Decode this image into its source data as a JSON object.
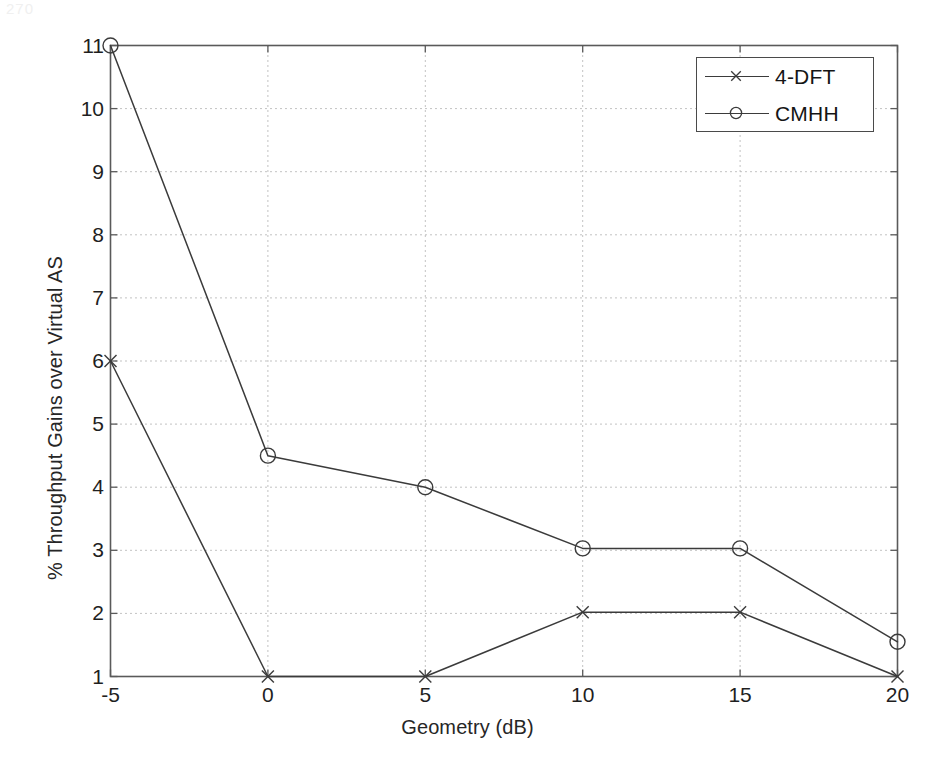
{
  "page": {
    "scan_artifact": "270"
  },
  "chart_data": {
    "type": "line",
    "title": "",
    "xlabel": "Geometry (dB)",
    "ylabel": "% Throughput Gains over Virtual AS",
    "x": [
      -5,
      0,
      5,
      10,
      15,
      20
    ],
    "xlim": [
      -5,
      20
    ],
    "ylim": [
      1,
      11
    ],
    "xticks": [
      "-5",
      "0",
      "5",
      "10",
      "15",
      "20"
    ],
    "yticks": [
      "1",
      "2",
      "3",
      "4",
      "5",
      "6",
      "7",
      "8",
      "9",
      "10",
      "11"
    ],
    "xtick_values": [
      -5,
      0,
      5,
      10,
      15,
      20
    ],
    "ytick_values": [
      1,
      2,
      3,
      4,
      5,
      6,
      7,
      8,
      9,
      10,
      11
    ],
    "grid": "dotted",
    "grid_color": "#bbbbbb",
    "legend_position": "upper right",
    "line_color": "#3b3b3b",
    "series": [
      {
        "name": "4-DFT",
        "marker": "x",
        "values": [
          6.0,
          1.0,
          1.0,
          2.02,
          2.02,
          1.0
        ]
      },
      {
        "name": "CMHH",
        "marker": "o",
        "values": [
          11.0,
          4.5,
          4.0,
          3.03,
          3.03,
          1.55
        ]
      }
    ]
  },
  "legend": {
    "items": [
      {
        "label": "4-DFT",
        "marker": "cross-marker-icon"
      },
      {
        "label": "CMHH",
        "marker": "circle-marker-icon"
      }
    ]
  }
}
